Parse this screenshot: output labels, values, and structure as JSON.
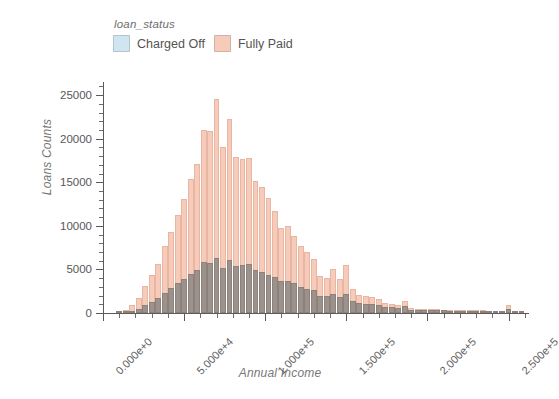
{
  "legend": {
    "title": "loan_status",
    "entries": [
      {
        "label": "Charged Off",
        "color": "#cfe6f2"
      },
      {
        "label": "Fully Paid",
        "color": "#f6cbba"
      }
    ]
  },
  "axes": {
    "ylabel": "Loans Counts",
    "xlabel": "Annual Income",
    "y_ticks": [
      "0",
      "5000",
      "10000",
      "15000",
      "20000",
      "25000"
    ],
    "x_ticks": [
      "0.000e+0",
      "5.000e+4",
      "1.000e+5",
      "1.500e+5",
      "2.000e+5",
      "2.500e+5"
    ]
  },
  "chart_data": {
    "type": "bar",
    "title": "",
    "subtitle": "",
    "xlabel": "Annual Income",
    "ylabel": "Loans Counts",
    "xlim": [
      0,
      262000
    ],
    "ylim": [
      0,
      26500
    ],
    "grid": false,
    "legend_position": "top-left",
    "legend_title": "loan_status",
    "overlap_mode": "overlay",
    "bin_width": 4000,
    "annotations": [],
    "x": [
      10000,
      14000,
      18000,
      22000,
      26000,
      30000,
      34000,
      38000,
      42000,
      46000,
      50000,
      54000,
      58000,
      62000,
      66000,
      70000,
      74000,
      78000,
      82000,
      86000,
      90000,
      94000,
      98000,
      102000,
      106000,
      110000,
      114000,
      118000,
      122000,
      126000,
      130000,
      134000,
      138000,
      142000,
      146000,
      150000,
      154000,
      158000,
      162000,
      166000,
      170000,
      174000,
      178000,
      182000,
      186000,
      190000,
      194000,
      198000,
      202000,
      206000,
      210000,
      214000,
      218000,
      222000,
      226000,
      230000,
      234000,
      238000,
      242000,
      246000,
      250000,
      254000,
      258000
    ],
    "series": [
      {
        "name": "Fully Paid",
        "color": "#f6cbba",
        "values": [
          150,
          400,
          900,
          1700,
          3100,
          4400,
          5600,
          7700,
          9300,
          11300,
          13100,
          15400,
          17100,
          21000,
          20900,
          24500,
          19100,
          22200,
          17900,
          17700,
          17800,
          15100,
          14400,
          13200,
          11700,
          9800,
          10000,
          8800,
          7700,
          7000,
          6200,
          4300,
          4000,
          5100,
          3900,
          5500,
          2800,
          2100,
          1900,
          1800,
          1650,
          1100,
          1000,
          900,
          1400,
          550,
          500,
          480,
          450,
          430,
          400,
          380,
          360,
          340,
          330,
          300,
          290,
          280,
          260,
          250,
          900,
          60,
          40
        ]
      },
      {
        "name": "Charged Off",
        "color": "#cfe6f2",
        "values": [
          40,
          110,
          260,
          500,
          900,
          1300,
          1700,
          2300,
          2900,
          3400,
          3900,
          4500,
          4900,
          5900,
          5700,
          6300,
          5200,
          6100,
          5400,
          5500,
          5600,
          4900,
          4700,
          4400,
          4100,
          3700,
          3700,
          3400,
          3000,
          2800,
          2600,
          2000,
          1900,
          2200,
          1800,
          2200,
          1400,
          1150,
          1050,
          1000,
          950,
          700,
          640,
          580,
          820,
          380,
          350,
          330,
          320,
          300,
          290,
          270,
          260,
          250,
          240,
          220,
          210,
          200,
          190,
          180,
          450,
          45,
          30
        ]
      }
    ]
  }
}
